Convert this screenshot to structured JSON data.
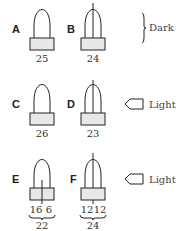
{
  "rows": [
    {
      "condition": "Dark",
      "figures": [
        {
          "label": "A",
          "split": false,
          "value": "25"
        },
        {
          "label": "B",
          "split": "full",
          "value": "24"
        }
      ]
    },
    {
      "condition": "Light",
      "figures": [
        {
          "label": "C",
          "split": false,
          "value": "26"
        },
        {
          "label": "D",
          "split": "full",
          "value": "23"
        }
      ]
    },
    {
      "condition": "Light",
      "figures": [
        {
          "label": "E",
          "split": "base",
          "left_value": "16",
          "right_value": "6",
          "value": "22"
        },
        {
          "label": "F",
          "split": "full",
          "left_value": "12",
          "right_value": "12",
          "value": "24"
        }
      ]
    }
  ],
  "icons": {
    "dark_indicator": "right-brace",
    "light_indicator": "left-arrow"
  }
}
